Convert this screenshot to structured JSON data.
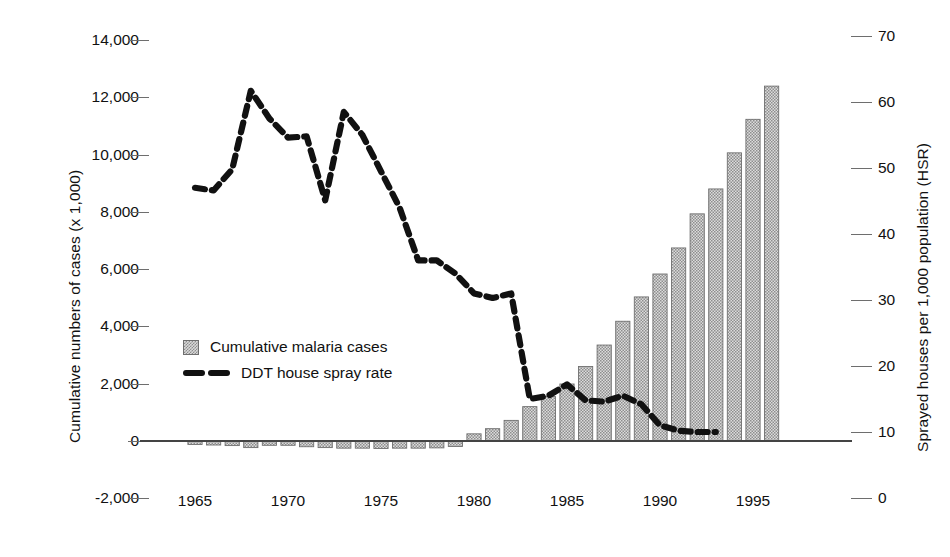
{
  "chart_data": {
    "type": "bar",
    "title": "",
    "subtitle": "",
    "xlabel": "",
    "ylabel": "Cumulative numbers of cases (x 1,000)",
    "y2label": "Sprayed houses per 1,000 population (HSR)",
    "grid": false,
    "legend_position": "inside-left",
    "xlim": [
      1963.2,
      1996.8
    ],
    "ylim": [
      -2000,
      14000
    ],
    "y2lim": [
      0,
      70
    ],
    "x_ticks": [
      "1965",
      "1970",
      "1975",
      "1980",
      "1985",
      "1990",
      "1995"
    ],
    "x_tick_values": [
      1965,
      1970,
      1975,
      1980,
      1985,
      1990,
      1995
    ],
    "y_ticks": [
      "-2,000",
      "0",
      "2,000",
      "4,000",
      "6,000",
      "8,000",
      "10,000",
      "12,000",
      "14,000"
    ],
    "y_tick_values": [
      -2000,
      0,
      2000,
      4000,
      6000,
      8000,
      10000,
      12000,
      14000
    ],
    "y2_ticks": [
      "0",
      "10",
      "20",
      "30",
      "40",
      "50",
      "60",
      "70"
    ],
    "y2_tick_values": [
      0,
      10,
      20,
      30,
      40,
      50,
      60,
      70
    ],
    "legend": [
      "Cumulative malaria cases",
      "DDT house spray rate"
    ],
    "series": [
      {
        "name": "Cumulative malaria cases",
        "type": "bar",
        "axis": "left",
        "unit": "cases (x 1,000)",
        "x": [
          1964,
          1965,
          1966,
          1967,
          1968,
          1969,
          1970,
          1971,
          1972,
          1973,
          1974,
          1975,
          1976,
          1977,
          1978,
          1979,
          1980,
          1981,
          1982,
          1983,
          1984,
          1985,
          1986,
          1987,
          1988,
          1989,
          1990,
          1991,
          1992,
          1993,
          1994,
          1995,
          1996
        ],
        "values": [
          0,
          -120,
          -140,
          -160,
          -230,
          -150,
          -150,
          -200,
          -230,
          -250,
          -250,
          -260,
          -250,
          -250,
          -240,
          -190,
          250,
          430,
          720,
          1200,
          1550,
          1990,
          2600,
          3350,
          4180,
          5030,
          5830,
          6740,
          7930,
          8800,
          10060,
          11230,
          12390
        ]
      },
      {
        "name": "DDT house spray rate",
        "type": "line",
        "axis": "right",
        "unit": "sprayed houses per 1,000 population",
        "x": [
          1965,
          1966,
          1967,
          1968,
          1969,
          1970,
          1971,
          1972,
          1973,
          1974,
          1975,
          1976,
          1977,
          1978,
          1979,
          1980,
          1981,
          1982,
          1983,
          1984,
          1985,
          1986,
          1987,
          1988,
          1989,
          1990,
          1991,
          1992,
          1993
        ],
        "values": [
          47.0,
          46.6,
          49.8,
          61.7,
          57.5,
          54.6,
          54.8,
          45.1,
          58.5,
          55.0,
          49.5,
          44.0,
          36.0,
          36.0,
          34.0,
          31.0,
          30.3,
          31.0,
          15.0,
          15.5,
          17.2,
          14.8,
          14.6,
          15.5,
          14.2,
          11.0,
          10.2,
          10.0,
          10.0
        ]
      }
    ]
  },
  "axes": {
    "left_title": "Cumulative numbers of cases (x 1,000)",
    "right_title": "Sprayed houses per 1,000 population (HSR)"
  },
  "legend": {
    "bar_label": "Cumulative malaria cases",
    "line_label": "DDT house spray rate"
  },
  "colors": {
    "bar_fill": "#d8d8d8",
    "bar_hatch": "#8e8e8e",
    "bar_edge": "#6f6f6f",
    "line": "#111111",
    "axis": "#555555",
    "text": "#111111",
    "background": "#ffffff"
  }
}
